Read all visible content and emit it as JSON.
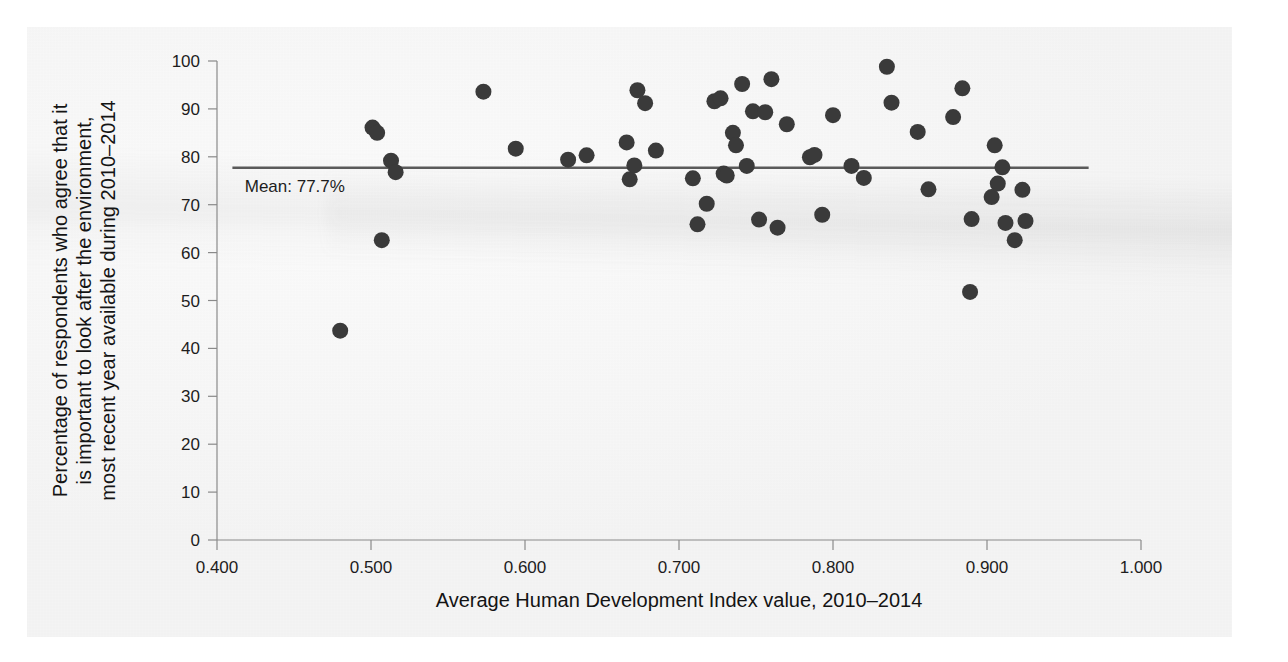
{
  "chart_data": {
    "type": "scatter",
    "title": "",
    "xlabel": "Average Human Development Index value, 2010–2014",
    "ylabel_lines": [
      "Percentage of respondents who agree that it",
      "is important to look after the environment,",
      "most recent year available during 2010–2014"
    ],
    "ylabel": "Percentage of respondents who agree that it is important to look after the environment, most recent year available during 2010–2014",
    "xlim": [
      0.4,
      1.0
    ],
    "ylim": [
      0,
      100
    ],
    "xticks": [
      "0.400",
      "0.500",
      "0.600",
      "0.700",
      "0.800",
      "0.900",
      "1.000"
    ],
    "xtick_values": [
      0.4,
      0.5,
      0.6,
      0.7,
      0.8,
      0.9,
      1.0
    ],
    "yticks": [
      "0",
      "10",
      "20",
      "30",
      "40",
      "50",
      "60",
      "70",
      "80",
      "90",
      "100"
    ],
    "ytick_values": [
      0,
      10,
      20,
      30,
      40,
      50,
      60,
      70,
      80,
      90,
      100
    ],
    "grid": false,
    "legend": "none",
    "marker_color": "#3a3a3a",
    "marker_radius": 8,
    "annotations": [
      {
        "name": "mean-line",
        "label": "Mean: 77.7%",
        "value": 77.7,
        "kind": "horizontal-reference-line",
        "x_start": 0.41,
        "x_end": 0.966,
        "color": "#5a5a5a",
        "label_x": 0.418,
        "label_y": 74.0
      }
    ],
    "points": [
      {
        "x": 0.48,
        "y": 43.7
      },
      {
        "x": 0.501,
        "y": 86.1
      },
      {
        "x": 0.504,
        "y": 85.0
      },
      {
        "x": 0.507,
        "y": 62.6
      },
      {
        "x": 0.513,
        "y": 79.2
      },
      {
        "x": 0.516,
        "y": 76.8
      },
      {
        "x": 0.573,
        "y": 93.6
      },
      {
        "x": 0.594,
        "y": 81.7
      },
      {
        "x": 0.628,
        "y": 79.4
      },
      {
        "x": 0.64,
        "y": 80.3
      },
      {
        "x": 0.666,
        "y": 83.0
      },
      {
        "x": 0.668,
        "y": 75.3
      },
      {
        "x": 0.671,
        "y": 78.2
      },
      {
        "x": 0.673,
        "y": 93.9
      },
      {
        "x": 0.678,
        "y": 91.2
      },
      {
        "x": 0.685,
        "y": 81.3
      },
      {
        "x": 0.709,
        "y": 75.5
      },
      {
        "x": 0.712,
        "y": 65.9
      },
      {
        "x": 0.718,
        "y": 70.2
      },
      {
        "x": 0.723,
        "y": 91.6
      },
      {
        "x": 0.727,
        "y": 92.2
      },
      {
        "x": 0.729,
        "y": 76.5
      },
      {
        "x": 0.731,
        "y": 76.1
      },
      {
        "x": 0.735,
        "y": 85.0
      },
      {
        "x": 0.737,
        "y": 82.4
      },
      {
        "x": 0.741,
        "y": 95.2
      },
      {
        "x": 0.744,
        "y": 78.1
      },
      {
        "x": 0.748,
        "y": 89.5
      },
      {
        "x": 0.752,
        "y": 66.9
      },
      {
        "x": 0.756,
        "y": 89.3
      },
      {
        "x": 0.76,
        "y": 96.2
      },
      {
        "x": 0.764,
        "y": 65.2
      },
      {
        "x": 0.77,
        "y": 86.8
      },
      {
        "x": 0.785,
        "y": 79.9
      },
      {
        "x": 0.788,
        "y": 80.4
      },
      {
        "x": 0.793,
        "y": 67.9
      },
      {
        "x": 0.8,
        "y": 88.7
      },
      {
        "x": 0.812,
        "y": 78.1
      },
      {
        "x": 0.82,
        "y": 75.6
      },
      {
        "x": 0.835,
        "y": 98.8
      },
      {
        "x": 0.838,
        "y": 91.3
      },
      {
        "x": 0.855,
        "y": 85.2
      },
      {
        "x": 0.862,
        "y": 73.2
      },
      {
        "x": 0.878,
        "y": 88.3
      },
      {
        "x": 0.884,
        "y": 94.3
      },
      {
        "x": 0.889,
        "y": 51.8
      },
      {
        "x": 0.89,
        "y": 67.0
      },
      {
        "x": 0.903,
        "y": 71.6
      },
      {
        "x": 0.905,
        "y": 82.4
      },
      {
        "x": 0.907,
        "y": 74.4
      },
      {
        "x": 0.91,
        "y": 77.8
      },
      {
        "x": 0.912,
        "y": 66.2
      },
      {
        "x": 0.918,
        "y": 62.6
      },
      {
        "x": 0.923,
        "y": 73.1
      },
      {
        "x": 0.925,
        "y": 66.6
      }
    ]
  }
}
